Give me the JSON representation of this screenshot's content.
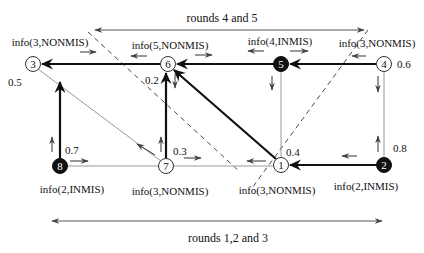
{
  "diagram": {
    "top_span": {
      "label": "rounds 4 and 5"
    },
    "bottom_span": {
      "label": "rounds 1,2 and 3"
    },
    "nodes": [
      {
        "id": "3",
        "label": "3",
        "fill": "white",
        "info": "info(3,NONMIS)",
        "weight": "0.5"
      },
      {
        "id": "6",
        "label": "6",
        "fill": "white",
        "info": "info(5,NONMIS)",
        "weight": "0.2"
      },
      {
        "id": "5",
        "label": "5",
        "fill": "black",
        "info": "info(4,INMIS)",
        "weight": ""
      },
      {
        "id": "4",
        "label": "4",
        "fill": "white",
        "info": "info(3,NONMIS)",
        "weight": "0.6"
      },
      {
        "id": "8",
        "label": "8",
        "fill": "black",
        "info": "info(2,INMIS)",
        "weight": "0.7"
      },
      {
        "id": "7",
        "label": "7",
        "fill": "white",
        "info": "info(3,NONMIS)",
        "weight": "0.3"
      },
      {
        "id": "1",
        "label": "1",
        "fill": "white",
        "info": "info(3,NONMIS)",
        "weight": "0.4"
      },
      {
        "id": "2",
        "label": "2",
        "fill": "black",
        "info": "info(2,INMIS)",
        "weight": "0.8"
      }
    ],
    "edges": [
      {
        "from": "6",
        "to": "3",
        "style": "bold-arrow"
      },
      {
        "from": "5",
        "to": "6",
        "style": "bold-arrow"
      },
      {
        "from": "4",
        "to": "5",
        "style": "bold-arrow"
      },
      {
        "from": "8",
        "to": "3",
        "style": "bold-arrow"
      },
      {
        "from": "7",
        "to": "6",
        "style": "bold-arrow"
      },
      {
        "from": "1",
        "to": "6",
        "style": "bold-arrow"
      },
      {
        "from": "2",
        "to": "1",
        "style": "bold-arrow"
      },
      {
        "from": "3",
        "to": "7",
        "style": "thin"
      },
      {
        "from": "8",
        "to": "7",
        "style": "thin"
      },
      {
        "from": "7",
        "to": "1",
        "style": "thin"
      },
      {
        "from": "5",
        "to": "1",
        "style": "thin"
      },
      {
        "from": "4",
        "to": "2",
        "style": "thin"
      }
    ]
  }
}
